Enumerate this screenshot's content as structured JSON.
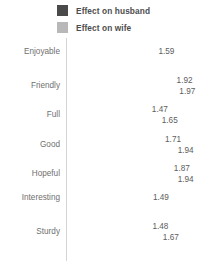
{
  "chart_data": {
    "type": "bar",
    "orientation": "horizontal",
    "title": "",
    "subtitle": "",
    "xlabel": "",
    "ylabel": "",
    "grid": false,
    "legend_position": "top",
    "xlim": [
      0,
      2.2
    ],
    "axis_line_value": 0,
    "categories": [
      "Enjoyable",
      "Friendly",
      "Full",
      "Good",
      "Hopeful",
      "Interesting",
      "Sturdy"
    ],
    "series": [
      {
        "name": "Effect on husband",
        "color": "#4a4a4a",
        "values": [
          null,
          1.92,
          1.47,
          1.71,
          1.87,
          1.49,
          1.48
        ]
      },
      {
        "name": "Effect on wife",
        "color": "#b8b8b8",
        "values": [
          1.59,
          1.97,
          1.65,
          1.94,
          1.94,
          null,
          1.67
        ]
      }
    ],
    "data_labels": [
      {
        "category": "Enjoyable",
        "husband": "",
        "wife": "1.59"
      },
      {
        "category": "Friendly",
        "husband": "1.92",
        "wife": "1.97"
      },
      {
        "category": "Full",
        "husband": "1.47",
        "wife": "1.65"
      },
      {
        "category": "Good",
        "husband": "1.71",
        "wife": "1.94"
      },
      {
        "category": "Hopeful",
        "husband": "1.87",
        "wife": "1.94"
      },
      {
        "category": "Interesting",
        "husband": "1.49",
        "wife": ""
      },
      {
        "category": "Sturdy",
        "husband": "1.48",
        "wife": "1.67"
      }
    ]
  },
  "legend": {
    "items": [
      {
        "label": "Effect on husband",
        "color": "#4a4a4a"
      },
      {
        "label": "Effect on wife",
        "color": "#b8b8b8"
      }
    ]
  },
  "top_clipped_text": ""
}
